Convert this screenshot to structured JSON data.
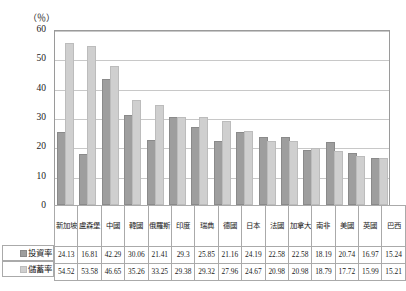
{
  "unit_label": "（％）",
  "series_labels": {
    "investment": "投資率",
    "savings": "儲蓄率"
  },
  "colors": {
    "investment_bar": "#9e9e9e",
    "savings_bar": "#cfcfcf",
    "gridline": "#c8c8c8",
    "axis": "#9a9a9a",
    "table_border": "#aaaaaa"
  },
  "chart_data": {
    "type": "bar",
    "title": "",
    "subtitle": "",
    "xlabel": "",
    "ylabel": "（％）",
    "ylim": [
      0,
      60
    ],
    "yticks": [
      0,
      10,
      20,
      30,
      40,
      50,
      60
    ],
    "grid": true,
    "legend_position": "table-row-labels",
    "categories": [
      "新加坡",
      "盧森堡",
      "中國",
      "韓國",
      "俄羅斯",
      "印度",
      "瑞典",
      "德國",
      "日本",
      "法國",
      "加拿大",
      "南非",
      "美國",
      "英國",
      "巴西"
    ],
    "series": [
      {
        "name": "投資率",
        "values": [
          24.13,
          16.81,
          42.29,
          30.06,
          21.41,
          29.3,
          25.85,
          21.16,
          24.19,
          22.58,
          22.58,
          18.19,
          20.74,
          16.97,
          15.24
        ]
      },
      {
        "name": "儲蓄率",
        "values": [
          54.52,
          53.58,
          46.65,
          35.26,
          33.25,
          29.38,
          29.32,
          27.96,
          24.67,
          20.98,
          20.98,
          18.79,
          17.72,
          15.99,
          15.21
        ]
      }
    ]
  }
}
